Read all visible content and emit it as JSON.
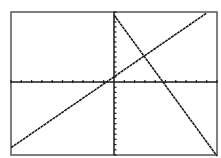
{
  "chart_data": {
    "type": "line",
    "title": "",
    "xlabel": "",
    "ylabel": "",
    "xlim": [
      -10,
      10
    ],
    "ylim": [
      -14,
      14
    ],
    "xscl": 1,
    "yscl": 1,
    "grid": false,
    "legend": null,
    "series": [
      {
        "name": "Y1",
        "description": "increasing line",
        "x": [
          -10,
          9
        ],
        "y": [
          -12.6,
          13.8
        ]
      },
      {
        "name": "Y2",
        "description": "decreasing line",
        "x": [
          0,
          10
        ],
        "y": [
          13.4,
          -14.2
        ]
      }
    ],
    "intersection": {
      "x": 3.0,
      "y": 5.6
    }
  },
  "frame": {
    "left": 11,
    "top": 12,
    "right": 217,
    "bottom": 155
  },
  "origin_px": {
    "x": 114,
    "y": 82
  },
  "colors": {
    "background": "#ffffff",
    "ink": "#1a1a1a",
    "frame": "#555555"
  }
}
